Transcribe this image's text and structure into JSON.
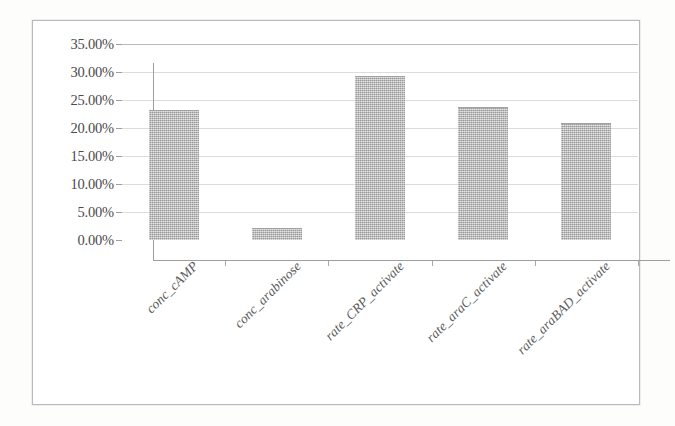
{
  "chart_data": {
    "type": "bar",
    "title": "",
    "subtitle": "",
    "xlabel": "",
    "ylabel": "",
    "categories": [
      "conc_cAMP",
      "conc_arabinose",
      "rate_CRP_activate",
      "rate_araC_activate",
      "rate_araBAD_activate"
    ],
    "values": [
      23.2,
      2.1,
      29.2,
      23.7,
      20.9
    ],
    "value_suffix": "%",
    "ylim": [
      0,
      35
    ],
    "ytick_labels": [
      "35.00%",
      "30.00%",
      "25.00%",
      "20.00%",
      "15.00%",
      "10.00%",
      "5.00%",
      "0.00%"
    ],
    "ytick_values": [
      35,
      30,
      25,
      20,
      15,
      10,
      5,
      0
    ],
    "grid": true,
    "grid_axis": "y",
    "legend": false,
    "legend_position": "none",
    "bar_color": "#b3b3b3",
    "gridline_color": "#dcdcdc",
    "axis_color": "#9e9e9e",
    "label_color": "#4a4a4a",
    "frame_color": "#b9b9b9"
  }
}
